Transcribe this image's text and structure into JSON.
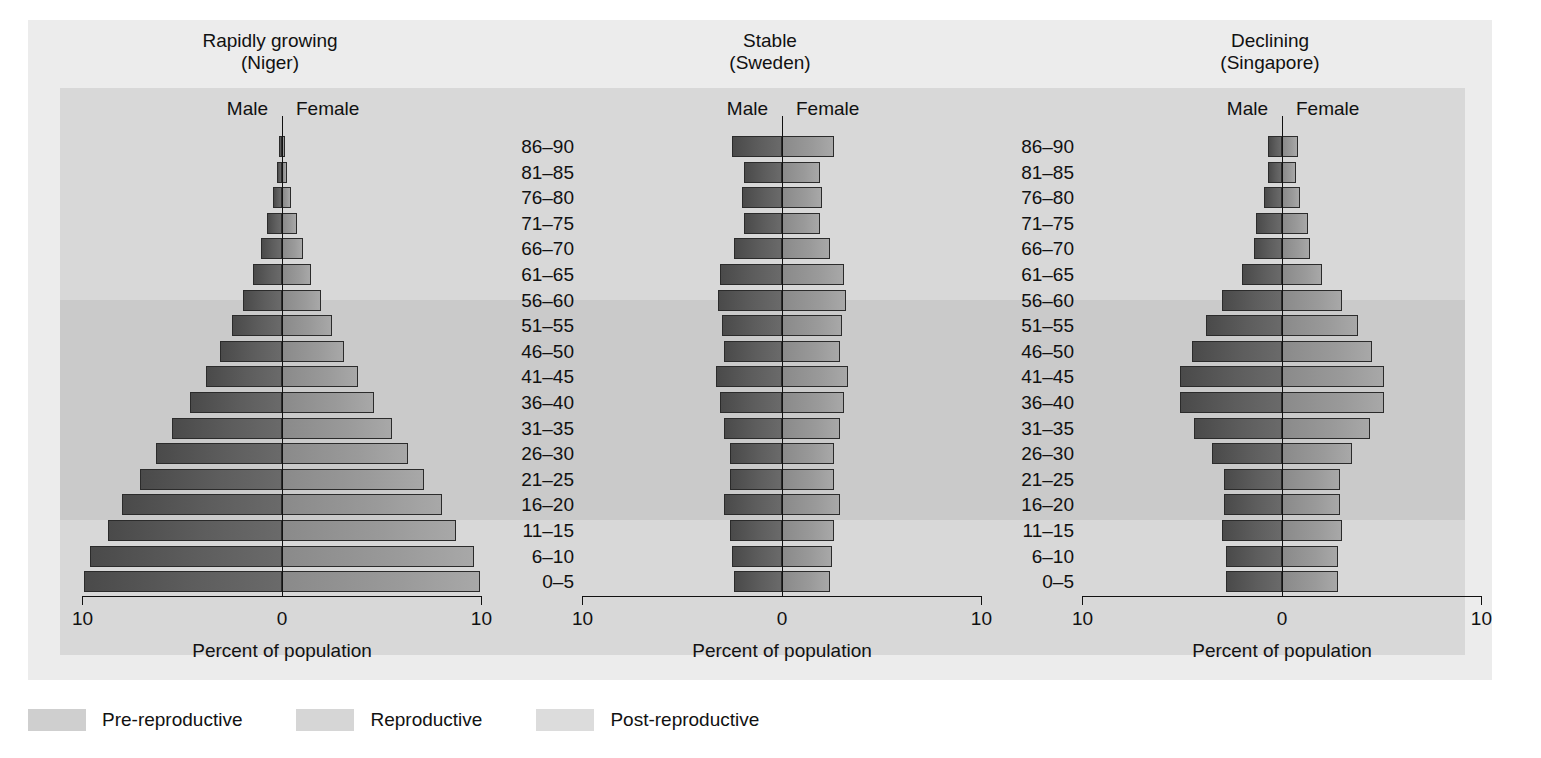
{
  "figure": {
    "x_axis_title": "Percent of population",
    "axis_ticks": {
      "left": "10",
      "center": "0",
      "right": "10"
    },
    "male_label": "Male",
    "female_label": "Female"
  },
  "age_groups": [
    "86–90",
    "81–85",
    "76–80",
    "71–75",
    "66–70",
    "61–65",
    "56–60",
    "51–55",
    "46–50",
    "41–45",
    "36–40",
    "31–35",
    "26–30",
    "21–25",
    "16–20",
    "11–15",
    "6–10",
    "0–5"
  ],
  "panels": [
    {
      "title_line1": "Rapidly growing",
      "title_line2": "(Niger)"
    },
    {
      "title_line1": "Stable",
      "title_line2": "(Sweden)"
    },
    {
      "title_line1": "Declining",
      "title_line2": "(Singapore)"
    }
  ],
  "legend": {
    "items": [
      {
        "label": "Pre-reproductive",
        "color": "#cfcfcf"
      },
      {
        "label": "Reproductive",
        "color": "#d6d6d6"
      },
      {
        "label": "Post-reproductive",
        "color": "#dcdcdc"
      }
    ]
  },
  "colors": {
    "page_background": "#ffffff",
    "panel_background": "#ececec",
    "plot_band": "#d2d2d2",
    "band_pre": "#d8d8d8",
    "band_reproductive": "#cacaca",
    "band_post": "#d8d8d8",
    "bar_male": "#5d5d5d",
    "bar_female": "#9a9a9a",
    "axis": "#111111"
  },
  "chart_data": {
    "type": "bar",
    "subtype": "population-pyramid",
    "xlabel": "Percent of population",
    "ylabel": "Age group (years)",
    "xlim": [
      -10,
      10
    ],
    "xticks": [
      -10,
      0,
      10
    ],
    "xticklabels": [
      "10",
      "0",
      "10"
    ],
    "grid": false,
    "legend_position": "bottom-left",
    "categories": [
      "86–90",
      "81–85",
      "76–80",
      "71–75",
      "66–70",
      "61–65",
      "56–60",
      "51–55",
      "46–50",
      "41–45",
      "36–40",
      "31–35",
      "26–30",
      "21–25",
      "16–20",
      "11–15",
      "6–10",
      "0–5"
    ],
    "age_bands": {
      "pre_reproductive": [
        "0–5",
        "6–10",
        "11–15"
      ],
      "reproductive": [
        "16–20",
        "21–25",
        "26–30",
        "31–35",
        "36–40",
        "41–45"
      ],
      "post_reproductive": [
        "46–50",
        "51–55",
        "56–60",
        "61–65",
        "66–70",
        "71–75",
        "76–80",
        "81–85",
        "86–90"
      ]
    },
    "panels": [
      {
        "name": "Rapidly growing (Niger)",
        "series": [
          {
            "name": "Male",
            "values": [
              0.15,
              0.25,
              0.45,
              0.75,
              1.05,
              1.45,
              1.95,
              2.5,
              3.1,
              3.8,
              4.6,
              5.5,
              6.3,
              7.1,
              8.0,
              8.7,
              9.6,
              9.9
            ]
          },
          {
            "name": "Female",
            "values": [
              0.15,
              0.25,
              0.45,
              0.75,
              1.05,
              1.45,
              1.95,
              2.5,
              3.1,
              3.8,
              4.6,
              5.5,
              6.3,
              7.1,
              8.0,
              8.7,
              9.6,
              9.9
            ]
          }
        ]
      },
      {
        "name": "Stable (Sweden)",
        "series": [
          {
            "name": "Male",
            "values": [
              2.5,
              1.9,
              2.0,
              1.9,
              2.4,
              3.1,
              3.2,
              3.0,
              2.9,
              3.3,
              3.1,
              2.9,
              2.6,
              2.6,
              2.9,
              2.6,
              2.5,
              2.4
            ]
          },
          {
            "name": "Female",
            "values": [
              2.6,
              1.9,
              2.0,
              1.9,
              2.4,
              3.1,
              3.2,
              3.0,
              2.9,
              3.3,
              3.1,
              2.9,
              2.6,
              2.6,
              2.9,
              2.6,
              2.5,
              2.4
            ]
          }
        ]
      },
      {
        "name": "Declining (Singapore)",
        "series": [
          {
            "name": "Male",
            "values": [
              0.7,
              0.7,
              0.9,
              1.3,
              1.4,
              2.0,
              3.0,
              3.8,
              4.5,
              5.1,
              5.1,
              4.4,
              3.5,
              2.9,
              2.9,
              3.0,
              2.8,
              2.8
            ]
          },
          {
            "name": "Female",
            "values": [
              0.8,
              0.7,
              0.9,
              1.3,
              1.4,
              2.0,
              3.0,
              3.8,
              4.5,
              5.1,
              5.1,
              4.4,
              3.5,
              2.9,
              2.9,
              3.0,
              2.8,
              2.8
            ]
          }
        ]
      }
    ]
  }
}
